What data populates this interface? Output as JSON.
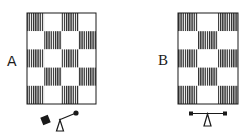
{
  "figures": [
    {
      "label": "A",
      "grid": {
        "cols": 4,
        "rows": 5,
        "pattern": [
          [
            1,
            0,
            1,
            0
          ],
          [
            0,
            1,
            0,
            1
          ],
          [
            1,
            0,
            1,
            0
          ],
          [
            0,
            1,
            0,
            1
          ],
          [
            1,
            0,
            1,
            0
          ]
        ]
      },
      "balance": {
        "state": "tilted",
        "left_weight": "large-square",
        "right_weight": "small-dot"
      }
    },
    {
      "label": "B",
      "grid": {
        "cols": 3,
        "rows": 5,
        "pattern": [
          [
            1,
            0,
            1
          ],
          [
            0,
            1,
            0
          ],
          [
            1,
            0,
            1
          ],
          [
            0,
            1,
            0
          ],
          [
            1,
            0,
            1
          ]
        ]
      },
      "balance": {
        "state": "level",
        "left_weight": "small-square",
        "right_weight": "small-square"
      }
    }
  ],
  "colors": {
    "ink": "#1a1a1a",
    "hatch": "#2b2b2b",
    "background": "#ffffff"
  }
}
